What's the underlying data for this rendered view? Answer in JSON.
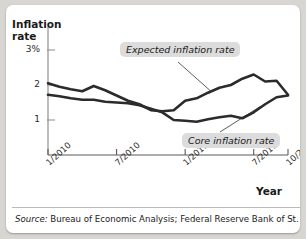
{
  "figure": {
    "source_lead": "Source:",
    "source_text": " Bureau of Economic Analysis; Federal Reserve Bank of St. Louis."
  },
  "chart_data": {
    "type": "line",
    "title": "",
    "xlabel": "Year",
    "ylabel": "Inflation\nrate",
    "ylim": [
      0,
      3
    ],
    "yticks": [
      1,
      2,
      3
    ],
    "ytick_labels": [
      "1",
      "2",
      "3%"
    ],
    "xtick_labels": [
      "1/2010",
      "7/2010",
      "1/2011",
      "7/2011",
      "10/2011"
    ],
    "xtick_positions": [
      0,
      6,
      12,
      18,
      21
    ],
    "xlim": [
      0,
      21
    ],
    "grid": false,
    "legend_position": "inline-annotations",
    "annotations": [
      {
        "text": "Expected inflation rate",
        "target_series": "Expected inflation rate"
      },
      {
        "text": "Core inflation rate",
        "target_series": "Core inflation rate"
      }
    ],
    "x": [
      0,
      1,
      2,
      3,
      4,
      5,
      6,
      7,
      8,
      9,
      10,
      11,
      12,
      13,
      14,
      15,
      16,
      17,
      18,
      19,
      20,
      21
    ],
    "series": [
      {
        "name": "Expected inflation rate",
        "color": "#2b2b2b",
        "values": [
          2.05,
          1.95,
          1.88,
          1.82,
          1.97,
          1.85,
          1.7,
          1.55,
          1.45,
          1.28,
          1.25,
          1.28,
          1.55,
          1.62,
          1.78,
          1.92,
          2.0,
          2.18,
          2.3,
          2.1,
          2.12,
          1.72
        ]
      },
      {
        "name": "Core inflation rate",
        "color": "#2b2b2b",
        "values": [
          1.72,
          1.68,
          1.62,
          1.58,
          1.58,
          1.52,
          1.5,
          1.48,
          1.42,
          1.32,
          1.22,
          1.0,
          0.98,
          0.95,
          1.02,
          1.08,
          1.12,
          1.05,
          1.22,
          1.45,
          1.65,
          1.7
        ]
      }
    ]
  }
}
